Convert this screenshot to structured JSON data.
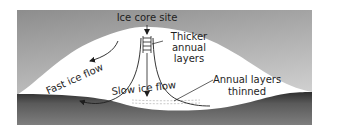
{
  "diagram": {
    "labels": {
      "ice_core_site": "Ice core site",
      "thicker_line1": "Thicker",
      "thicker_line2": "annual",
      "thicker_line3": "layers",
      "fast_ice_flow": "Fast ice flow",
      "slow_ice_flow": "Slow ice flow",
      "annual_thinned_line1": "Annual layers",
      "annual_thinned_line2": "thinned"
    },
    "colors": {
      "sky_top": "#8f8f8f",
      "sky_bottom": "#d2d2d2",
      "ice": "#ffffff",
      "bedrock_top": "#3c3c3c",
      "bedrock_bottom": "#7a7a7a",
      "ink": "#1e1e1e"
    }
  }
}
